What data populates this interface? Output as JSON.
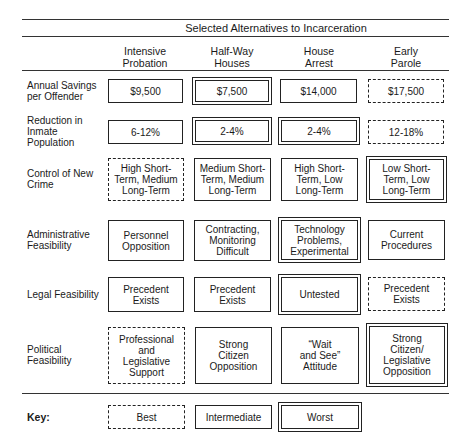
{
  "title": "Selected Alternatives to Incarceration",
  "columns": [
    {
      "label": "Intensive\nProbation"
    },
    {
      "label": "Half-Way\nHouses"
    },
    {
      "label": "House\nArrest"
    },
    {
      "label": "Early\nParole"
    }
  ],
  "rows": [
    {
      "label": "Annual Savings per Offender",
      "cells": [
        {
          "text": "$9,500",
          "rating": "intermediate"
        },
        {
          "text": "$7,500",
          "rating": "worst"
        },
        {
          "text": "$14,000",
          "rating": "intermediate"
        },
        {
          "text": "$17,500",
          "rating": "best"
        }
      ]
    },
    {
      "label": "Reduction in Inmate Population",
      "cells": [
        {
          "text": "6-12%",
          "rating": "intermediate"
        },
        {
          "text": "2-4%",
          "rating": "worst"
        },
        {
          "text": "2-4%",
          "rating": "worst"
        },
        {
          "text": "12-18%",
          "rating": "best"
        }
      ]
    },
    {
      "label": "Control of New Crime",
      "cells": [
        {
          "text": "High Short-\nTerm, Medium\nLong-Term",
          "rating": "best"
        },
        {
          "text": "Medium Short-\nTerm, Medium\nLong-Term",
          "rating": "intermediate"
        },
        {
          "text": "High Short-\nTerm, Low\nLong-Term",
          "rating": "intermediate"
        },
        {
          "text": "Low Short-\nTerm, Low\nLong-Term",
          "rating": "worst"
        }
      ]
    },
    {
      "label": "Administrative Feasibility",
      "cells": [
        {
          "text": "Personnel\nOpposition",
          "rating": "intermediate"
        },
        {
          "text": "Contracting,\nMonitoring\nDifficult",
          "rating": "intermediate"
        },
        {
          "text": "Technology\nProblems,\nExperimental",
          "rating": "worst"
        },
        {
          "text": "Current\nProcedures",
          "rating": "intermediate"
        }
      ]
    },
    {
      "label": "Legal Feasibility",
      "cells": [
        {
          "text": "Precedent\nExists",
          "rating": "intermediate"
        },
        {
          "text": "Precedent\nExists",
          "rating": "intermediate"
        },
        {
          "text": "Untested",
          "rating": "worst"
        },
        {
          "text": "Precedent\nExists",
          "rating": "best"
        }
      ]
    },
    {
      "label": "Political Feasibility",
      "cells": [
        {
          "text": "Professional and\nLegislative\nSupport",
          "rating": "best"
        },
        {
          "text": "Strong\nCitizen\nOpposition",
          "rating": "intermediate"
        },
        {
          "text": "“Wait\nand See”\nAttitude",
          "rating": "intermediate"
        },
        {
          "text": "Strong\nCitizen/\nLegislative\nOpposition",
          "rating": "worst"
        }
      ]
    }
  ],
  "key": {
    "label": "Key:",
    "items": [
      {
        "text": "Best",
        "rating": "best"
      },
      {
        "text": "Intermediate",
        "rating": "intermediate"
      },
      {
        "text": "Worst",
        "rating": "worst"
      }
    ]
  }
}
